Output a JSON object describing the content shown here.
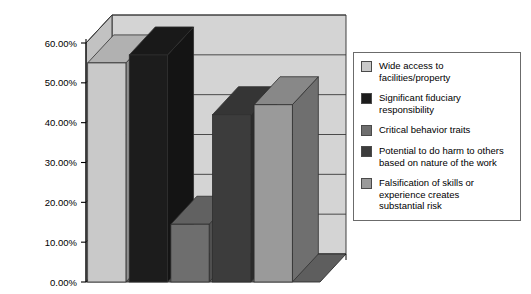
{
  "chart_data": {
    "type": "bar",
    "title": "",
    "subtitle": "",
    "xlabel": "",
    "ylabel": "",
    "grid": true,
    "three_d": true,
    "legend_position": "right",
    "ylim": [
      0,
      60
    ],
    "ytick_labels": [
      "60.00%",
      "50.00%",
      "40.00%",
      "30.00%",
      "20.00%",
      "10.00%",
      "0.00%"
    ],
    "ytick_values": [
      60,
      50,
      40,
      30,
      20,
      10,
      0
    ],
    "categories": [
      "Wide access to facilities/property",
      "Significant fiduciary responsibility",
      "Critical behavior traits",
      "Potential to do harm to others based on nature of the work",
      "Falsification of skills or experience creates substantial risk"
    ],
    "values": [
      55,
      57,
      14.5,
      42,
      44.5
    ],
    "value_labels": [
      "55.00%",
      "57.00%",
      "14.50%",
      "42.00%",
      "44.50%"
    ],
    "series": [
      {
        "name": "Survey response rate",
        "values": [
          55,
          57,
          14.5,
          42,
          44.5
        ]
      }
    ],
    "bar_colors": [
      "#c9c9c9",
      "#1c1c1c",
      "#6e6e6e",
      "#3c3c3c",
      "#9a9a9a"
    ]
  },
  "legend": {
    "items": [
      {
        "label": "Wide access to\nfacilities/property",
        "color": "#c9c9c9"
      },
      {
        "label": "Significant fiduciary\nresponsibility",
        "color": "#1c1c1c"
      },
      {
        "label": "Critical behavior traits",
        "color": "#6e6e6e"
      },
      {
        "label": "Potential to do harm to others\nbased on nature of the work",
        "color": "#3c3c3c"
      },
      {
        "label": "Falsification of skills or\nexperience creates\nsubstantial risk",
        "color": "#9a9a9a"
      }
    ]
  },
  "axis": {
    "ticks": [
      {
        "label": "60.00%",
        "value": 60
      },
      {
        "label": "50.00%",
        "value": 50
      },
      {
        "label": "40.00%",
        "value": 40
      },
      {
        "label": "30.00%",
        "value": 30
      },
      {
        "label": "20.00%",
        "value": 20
      },
      {
        "label": "10.00%",
        "value": 10
      },
      {
        "label": "0.00%",
        "value": 0
      }
    ]
  },
  "colors": {
    "back_wall": "#d4d4d4",
    "side_wall": "#c2c2c2",
    "floor": "#5e5e5e",
    "gridline": "#3a3a3a",
    "outline": "#2e2e2e",
    "legend_border": "#6b6b6b",
    "background": "#ffffff"
  }
}
